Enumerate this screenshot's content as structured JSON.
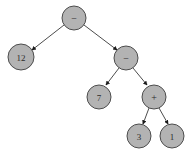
{
  "diagram": {
    "type": "expression-tree",
    "background_color": "#ffffff",
    "node_fill_color": "#b3b3b3",
    "node_stroke_color": "#4d4d4d",
    "edge_color": "#4d4d4d",
    "arrow_color": "#1a1a1a",
    "label_color": "#2b2b2b",
    "nodes": [
      {
        "id": "n0",
        "label": "−",
        "kind": "operator",
        "cx": 74,
        "cy": 18,
        "r": 12
      },
      {
        "id": "n1",
        "label": "12",
        "kind": "number",
        "cx": 21,
        "cy": 57,
        "r": 13
      },
      {
        "id": "n2",
        "label": "−",
        "kind": "operator",
        "cx": 126,
        "cy": 58,
        "r": 12
      },
      {
        "id": "n3",
        "label": "7",
        "kind": "number",
        "cx": 99,
        "cy": 97,
        "r": 12
      },
      {
        "id": "n4",
        "label": "+",
        "kind": "operator",
        "cx": 154,
        "cy": 97,
        "r": 12
      },
      {
        "id": "n5",
        "label": "3",
        "kind": "number",
        "cx": 139,
        "cy": 136,
        "r": 12
      },
      {
        "id": "n6",
        "label": "1",
        "kind": "number",
        "cx": 172,
        "cy": 136,
        "r": 12
      }
    ],
    "edges": [
      {
        "id": "e0",
        "from": "n0",
        "to": "n1",
        "x1": 64,
        "y1": 25,
        "x2": 32,
        "y2": 50
      },
      {
        "id": "e1",
        "from": "n0",
        "to": "n2",
        "x1": 84,
        "y1": 25,
        "x2": 117,
        "y2": 50
      },
      {
        "id": "e2",
        "from": "n2",
        "to": "n3",
        "x1": 119,
        "y1": 68,
        "x2": 106,
        "y2": 85
      },
      {
        "id": "e3",
        "from": "n2",
        "to": "n4",
        "x1": 133,
        "y1": 68,
        "x2": 147,
        "y2": 85
      },
      {
        "id": "e4",
        "from": "n4",
        "to": "n5",
        "x1": 149,
        "y1": 108,
        "x2": 143,
        "y2": 124
      },
      {
        "id": "e5",
        "from": "n4",
        "to": "n6",
        "x1": 159,
        "y1": 108,
        "x2": 168,
        "y2": 124
      }
    ]
  }
}
